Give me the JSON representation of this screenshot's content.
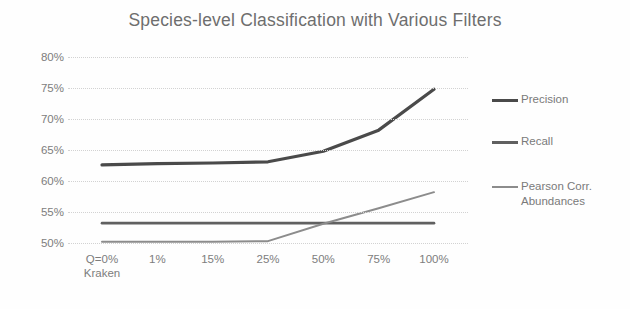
{
  "chart_data": {
    "type": "line",
    "title": "Species-level Classification with Various Filters",
    "xlabel": "",
    "ylabel": "",
    "categories": [
      "Q=0%\nKraken",
      "1%",
      "15%",
      "25%",
      "50%",
      "75%",
      "100%"
    ],
    "category_labels": [
      "Q=0%",
      "1%",
      "15%",
      "25%",
      "50%",
      "75%",
      "100%"
    ],
    "category_sublabel": "Kraken",
    "ylim": [
      50,
      80
    ],
    "ytick_labels": [
      "50%",
      "55%",
      "60%",
      "65%",
      "70%",
      "75%",
      "80%"
    ],
    "ytick_values": [
      50,
      55,
      60,
      65,
      70,
      75,
      80
    ],
    "grid": true,
    "legend_position": "right",
    "series": [
      {
        "name": "Precision",
        "values": [
          62.6,
          62.8,
          62.9,
          63.1,
          64.8,
          68.2,
          74.8
        ],
        "color": "#4a4a4a"
      },
      {
        "name": "Recall",
        "values": [
          53.2,
          53.2,
          53.2,
          53.2,
          53.2,
          53.2,
          53.2
        ],
        "color": "#606060"
      },
      {
        "name": "Pearson Corr.\nAbundances",
        "values": [
          50.2,
          50.2,
          50.2,
          50.3,
          53.1,
          55.6,
          58.2
        ],
        "color": "#8c8c8c"
      }
    ]
  },
  "legend": {
    "items": [
      {
        "label": "Precision"
      },
      {
        "label": "Recall"
      },
      {
        "label": "Pearson Corr.\nAbundances"
      }
    ]
  }
}
